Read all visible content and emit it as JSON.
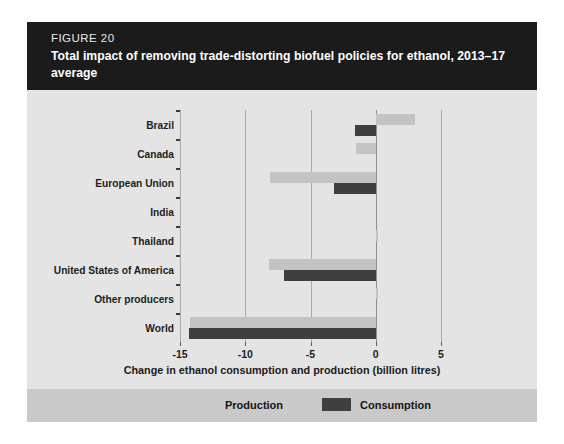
{
  "figure": {
    "number_label": "FIGURE 20",
    "title": "Total impact of removing trade-distorting biofuel policies for ethanol, 2013–17 average"
  },
  "legend": {
    "position": "bottom",
    "items": [
      {
        "label": "Production",
        "color": "#c9c9c9",
        "swatch_name": "production-swatch"
      },
      {
        "label": "Consumption",
        "color": "#3f3f3f",
        "swatch_name": "consumption-swatch"
      }
    ]
  },
  "axis": {
    "x_title": "Change in ethanol consumption and production (billion litres)",
    "x_ticks": [
      "-15",
      "-10",
      "-5",
      "0",
      "5"
    ]
  },
  "chart_data": {
    "type": "bar",
    "orientation": "horizontal",
    "title": "Total impact of removing trade-distorting biofuel policies for ethanol, 2013–17 average",
    "xlabel": "Change in ethanol consumption and production (billion litres)",
    "ylabel": "",
    "xlim": [
      -15,
      5
    ],
    "xticks": [
      -15,
      -10,
      -5,
      0,
      5
    ],
    "grid": true,
    "legend_position": "bottom",
    "categories": [
      "Brazil",
      "Canada",
      "European Union",
      "India",
      "Thailand",
      "United States of America",
      "Other producers",
      "World"
    ],
    "series": [
      {
        "name": "Production",
        "color": "#c3c3c3",
        "values": [
          3.0,
          -1.5,
          -8.1,
          0.0,
          0.2,
          -8.2,
          0.2,
          -14.2
        ]
      },
      {
        "name": "Consumption",
        "color": "#3f3f3f",
        "values": [
          -1.6,
          0.0,
          -3.2,
          0.0,
          0.0,
          -7.0,
          0.0,
          -14.3
        ]
      }
    ]
  }
}
